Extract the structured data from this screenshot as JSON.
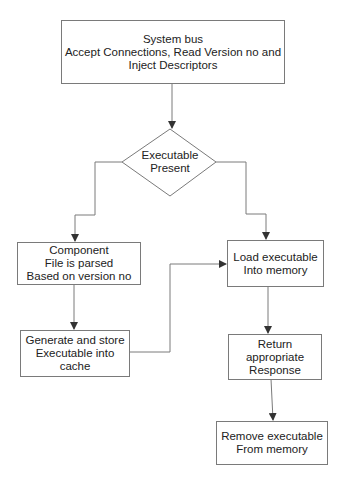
{
  "diagram": {
    "type": "flowchart",
    "nodes": [
      {
        "id": "system_bus",
        "shape": "rect",
        "label": "System bus\nAccept Connections, Read Version no and\nInject Descriptors"
      },
      {
        "id": "executable_present",
        "shape": "diamond",
        "label": "Executable\nPresent"
      },
      {
        "id": "component_parsed",
        "shape": "rect",
        "label": "Component\nFile is parsed\nBased on version no"
      },
      {
        "id": "generate_store",
        "shape": "rect",
        "label": "Generate and store\nExecutable into\ncache"
      },
      {
        "id": "load_executable",
        "shape": "rect",
        "label": "Load executable\nInto memory"
      },
      {
        "id": "return_response",
        "shape": "rect",
        "label": "Return appropriate\nResponse"
      },
      {
        "id": "remove_executable",
        "shape": "rect",
        "label": "Remove executable\nFrom memory"
      }
    ],
    "edges": [
      {
        "from": "system_bus",
        "to": "executable_present",
        "label": ""
      },
      {
        "from": "executable_present",
        "to": "component_parsed",
        "label": ""
      },
      {
        "from": "executable_present",
        "to": "load_executable",
        "label": ""
      },
      {
        "from": "component_parsed",
        "to": "generate_store",
        "label": ""
      },
      {
        "from": "generate_store",
        "to": "load_executable",
        "label": ""
      },
      {
        "from": "load_executable",
        "to": "return_response",
        "label": ""
      },
      {
        "from": "return_response",
        "to": "remove_executable",
        "label": ""
      }
    ],
    "colors": {
      "stroke": "#7a7a7a",
      "arrow": "#333333",
      "text": "#222222",
      "background": "#ffffff"
    }
  }
}
